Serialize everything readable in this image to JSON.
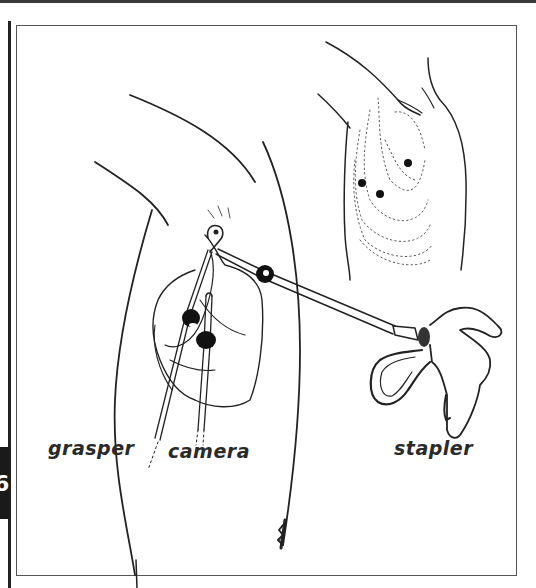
{
  "figure": {
    "page_tab": "6",
    "labels": {
      "grasper": "grasper",
      "camera": "camera",
      "stapler": "stapler"
    },
    "colors": {
      "ink": "#222222",
      "frame": "#555555",
      "background": "#ffffff"
    }
  }
}
